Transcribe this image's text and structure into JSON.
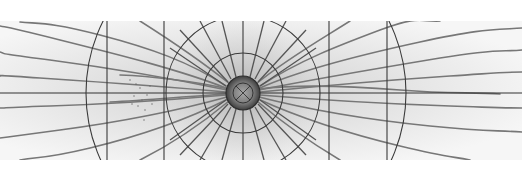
{
  "figure": {
    "colors": {
      "background": "#ffffff",
      "paper": "#ececec",
      "vessel": "#6a6a6a",
      "grid_line": "#3a3a3a",
      "disc": "#5a5a5a"
    },
    "geometry": {
      "image_top": 21,
      "image_bottom": 160,
      "center": [
        243,
        93
      ],
      "disc_radius": 17,
      "inner_ring_radius": 40,
      "middle_ring_radius": 77,
      "outer_arc_radius": 160,
      "vertical_lines_x": [
        107,
        164,
        329,
        387
      ]
    }
  }
}
